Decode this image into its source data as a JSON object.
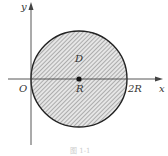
{
  "figure": {
    "type": "region-diagram",
    "axes": {
      "x_label": "x",
      "y_label": "y",
      "origin_label": "O"
    },
    "region": {
      "label": "D",
      "shape": "circle",
      "center_label": "R",
      "right_intercept_label": "2R",
      "fill": "hatched",
      "hatch_color": "#9a9a9a",
      "boundary_color": "#222222"
    },
    "caption": "图 1-1"
  }
}
